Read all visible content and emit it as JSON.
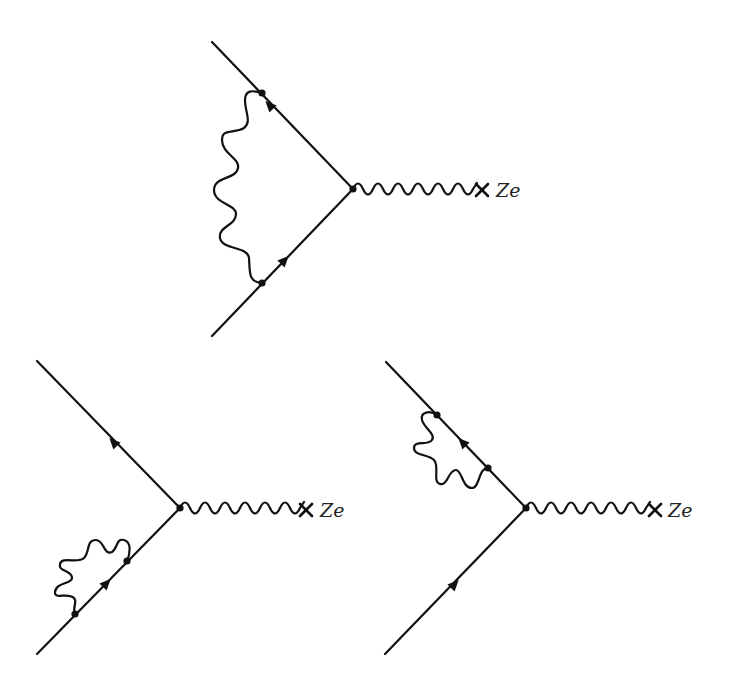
{
  "figure": {
    "caption_cutoff": "",
    "colors": {
      "ink": "#111111",
      "background": "#ffffff"
    },
    "diagrams": [
      {
        "id": "vertex-correction",
        "description": "Vertex correction: internal photon exchanged between incoming and outgoing electron lines",
        "external_field_label": "Ze",
        "vertex": [
          353,
          189
        ],
        "incoming_line": {
          "from": [
            212,
            336
          ],
          "to": [
            353,
            189
          ]
        },
        "outgoing_line": {
          "from": [
            353,
            189
          ],
          "to": [
            212,
            42
          ]
        },
        "internal_photon_endpoints": [
          [
            262,
            283
          ],
          [
            262,
            93
          ]
        ],
        "arrows": [
          [
            281,
            264
          ],
          [
            266,
            100
          ]
        ],
        "external_photon": {
          "from": [
            355,
            189
          ],
          "to": [
            477,
            189
          ],
          "humps": 6
        },
        "cross": [
          482,
          190
        ]
      },
      {
        "id": "self-energy-incoming",
        "description": "Self-energy insertion on incoming electron leg",
        "external_field_label": "Ze",
        "vertex": [
          180,
          508
        ],
        "incoming_line": {
          "from": [
            37,
            654
          ],
          "to": [
            180,
            508
          ]
        },
        "outgoing_line": {
          "from": [
            180,
            508
          ],
          "to": [
            37,
            361
          ]
        },
        "loop_endpoints": [
          [
            75,
            614
          ],
          [
            127,
            561
          ]
        ],
        "arrows": [
          [
            107,
            582
          ],
          [
            110,
            436
          ]
        ],
        "external_photon": {
          "from": [
            182,
            508
          ],
          "to": [
            302,
            508
          ],
          "humps": 6
        },
        "cross": [
          306,
          510
        ]
      },
      {
        "id": "self-energy-outgoing",
        "description": "Self-energy insertion on outgoing electron leg",
        "external_field_label": "Ze",
        "vertex": [
          526,
          508
        ],
        "incoming_line": {
          "from": [
            385,
            654
          ],
          "to": [
            526,
            508
          ]
        },
        "outgoing_line": {
          "from": [
            526,
            508
          ],
          "to": [
            386,
            362
          ]
        },
        "loop_endpoints": [
          [
            488,
            468
          ],
          [
            437,
            415
          ]
        ],
        "arrows": [
          [
            455,
            583
          ],
          [
            459,
            438
          ]
        ],
        "external_photon": {
          "from": [
            528,
            508
          ],
          "to": [
            650,
            508
          ],
          "humps": 6
        },
        "cross": [
          655,
          510
        ]
      }
    ]
  }
}
